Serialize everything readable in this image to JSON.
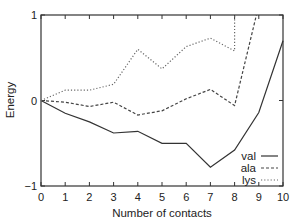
{
  "chart_data": {
    "type": "line",
    "title": "",
    "xlabel": "Number of contacts",
    "ylabel": "Energy",
    "xlim": [
      0,
      10
    ],
    "ylim": [
      -1,
      1
    ],
    "grid": false,
    "legend_position": "lower right",
    "x_ticks": [
      0,
      1,
      2,
      3,
      4,
      5,
      6,
      7,
      8,
      9,
      10
    ],
    "y_ticks": [
      -1,
      0,
      1
    ],
    "y_tick_labels": [
      "−1",
      "0",
      "1"
    ],
    "series": [
      {
        "name": "val",
        "style": "solid",
        "x": [
          0,
          1,
          2,
          3,
          4,
          5,
          6,
          7,
          8,
          9,
          10
        ],
        "values": [
          0,
          -0.15,
          -0.25,
          -0.38,
          -0.36,
          -0.5,
          -0.5,
          -0.78,
          -0.58,
          -0.14,
          0.7
        ]
      },
      {
        "name": "ala",
        "style": "dashed",
        "x": [
          0,
          1,
          2,
          3,
          4,
          5,
          6,
          7,
          8,
          8.9
        ],
        "values": [
          0,
          -0.02,
          -0.07,
          -0.02,
          -0.17,
          -0.12,
          0.02,
          0.13,
          -0.06,
          1.0
        ]
      },
      {
        "name": "lys",
        "style": "dotted",
        "x": [
          0,
          1,
          2,
          3,
          4,
          5,
          6,
          7,
          8,
          8
        ],
        "values": [
          0,
          0.12,
          0.12,
          0.19,
          0.6,
          0.37,
          0.63,
          0.73,
          0.58,
          1.0
        ]
      }
    ]
  }
}
